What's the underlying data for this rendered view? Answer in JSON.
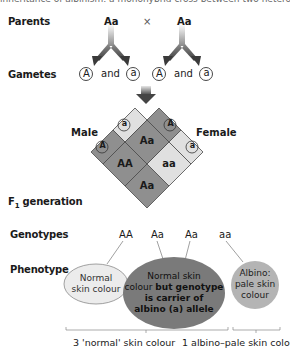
{
  "top_caption_cut": "inheritance of albinism: a monohybrid cross between two heterozygous parents",
  "labels": {
    "parents": "Parents",
    "gametes": "Gametes",
    "male": "Male",
    "female": "Female",
    "f1_prefix": "F",
    "f1_sub": "1",
    "f1_suffix": " generation",
    "genotypes": "Genotypes",
    "phenotype": "Phenotype"
  },
  "parents": {
    "left": "Aa",
    "cross": "×",
    "right": "Aa"
  },
  "gametes": {
    "left": {
      "first": "A",
      "and": "and",
      "second": "a"
    },
    "right": {
      "first": "A",
      "and": "and",
      "second": "a"
    }
  },
  "punnett": {
    "male_headers": [
      "a",
      "A"
    ],
    "female_headers": [
      "A",
      "a"
    ],
    "cells": {
      "top": "Aa",
      "left": "AA",
      "right": "aa",
      "bottom": "Aa"
    }
  },
  "genotypes": [
    "AA",
    "Aa",
    "Aa",
    "aa"
  ],
  "phenotypes": {
    "normal": {
      "line1": "Normal",
      "line2": "skin colour"
    },
    "carrier": {
      "line1": "Normal skin",
      "line2_normal": "colour ",
      "line2_bold": "but genotype",
      "line3": "is carrier of",
      "line4": "albino (a) allele"
    },
    "albino": {
      "line1": "Albino:",
      "line2": "pale skin",
      "line3": "colour"
    }
  },
  "ratio": {
    "normal": "3 'normal' skin colour",
    "albino": "1 albino–pale skin colour"
  },
  "colors": {
    "dark_cell": "#8f8f8f",
    "light_cell": "#e0e0e0",
    "normal_ellipse": "#ececec",
    "carrier_ellipse": "#7a7a7a",
    "albino_ellipse": "#b4b4b4",
    "arrow": "#5a5a5a"
  }
}
